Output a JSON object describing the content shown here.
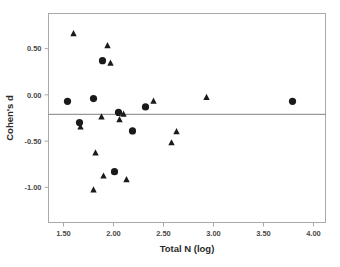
{
  "chart_data": {
    "type": "scatter",
    "title": "",
    "xlabel": "Total N (log)",
    "ylabel": "Cohen's d",
    "xlim": [
      1.35,
      4.12
    ],
    "ylim": [
      -1.38,
      0.88
    ],
    "xticks": [
      1.5,
      2.0,
      2.5,
      3.0,
      3.5,
      4.0
    ],
    "xticklabels": [
      "1.50",
      "2.00",
      "2.50",
      "3.00",
      "3.50",
      "4.00"
    ],
    "yticks": [
      0.5,
      0.0,
      -0.5,
      -1.0
    ],
    "yticklabels": [
      "0.50",
      "0.00",
      "-0.50",
      "-1.00"
    ],
    "grid": false,
    "legend": false,
    "reference_line": {
      "orientation": "horizontal",
      "y": -0.21,
      "color": "#808080"
    },
    "frame_color": "#a9a9a9",
    "marker_color": "#1a1a1a",
    "series": [
      {
        "name": "circles",
        "marker": "circle",
        "points": [
          {
            "x": 1.54,
            "y": -0.07
          },
          {
            "x": 1.66,
            "y": -0.3
          },
          {
            "x": 1.8,
            "y": -0.04
          },
          {
            "x": 1.89,
            "y": 0.37
          },
          {
            "x": 2.05,
            "y": -0.19
          },
          {
            "x": 2.01,
            "y": -0.83
          },
          {
            "x": 2.19,
            "y": -0.39
          },
          {
            "x": 2.32,
            "y": -0.13
          },
          {
            "x": 3.79,
            "y": -0.07
          }
        ]
      },
      {
        "name": "triangles",
        "marker": "triangle",
        "points": [
          {
            "x": 1.6,
            "y": 0.66
          },
          {
            "x": 1.67,
            "y": -0.35
          },
          {
            "x": 1.8,
            "y": -1.03
          },
          {
            "x": 1.82,
            "y": -0.63
          },
          {
            "x": 1.88,
            "y": -0.24
          },
          {
            "x": 1.9,
            "y": -0.88
          },
          {
            "x": 1.94,
            "y": 0.53
          },
          {
            "x": 1.97,
            "y": 0.34
          },
          {
            "x": 2.06,
            "y": -0.27
          },
          {
            "x": 2.1,
            "y": -0.21
          },
          {
            "x": 2.13,
            "y": -0.92
          },
          {
            "x": 2.4,
            "y": -0.07
          },
          {
            "x": 2.58,
            "y": -0.52
          },
          {
            "x": 2.63,
            "y": -0.4
          },
          {
            "x": 2.93,
            "y": -0.03
          }
        ]
      }
    ]
  }
}
